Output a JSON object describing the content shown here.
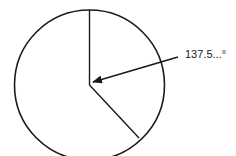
{
  "diagram": {
    "type": "circle-sector",
    "angle_label": "137.5...°",
    "colors": {
      "stroke": "#1a1a1a",
      "background": "#ffffff"
    }
  }
}
